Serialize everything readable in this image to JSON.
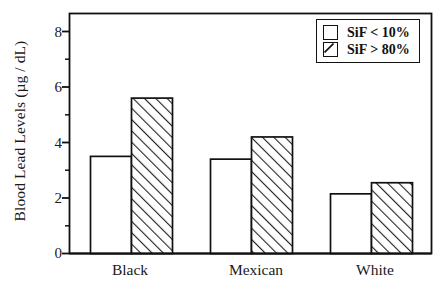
{
  "chart_data": {
    "type": "bar",
    "title": "",
    "subtitle": "",
    "xlabel": "",
    "ylabel": "Blood Lead Levels (µg / dL)",
    "categories": [
      "Black",
      "Mexican",
      "White"
    ],
    "series": [
      {
        "name": "SiF < 10%",
        "values": [
          3.5,
          3.4,
          2.15
        ],
        "fill": "open",
        "color": "#ffffff"
      },
      {
        "name": "SiF > 80%",
        "values": [
          5.6,
          4.2,
          2.55
        ],
        "fill": "hatched",
        "color": "#ffffff"
      }
    ],
    "ylim": [
      0,
      8.6
    ],
    "yticks": [
      0,
      2,
      4,
      6,
      8
    ],
    "ytick_labels": [
      "0",
      "2",
      "4",
      "6",
      "8"
    ],
    "yminor_ticks": [
      1,
      3,
      5,
      7
    ],
    "grid": false,
    "legend_position": "top-right",
    "frame": true,
    "axis_color": "#111111"
  },
  "axes": {
    "y_tick_labels": [
      "8",
      "6",
      "4",
      "2",
      "0"
    ],
    "x_tick_labels": [
      "Black",
      "Mexican",
      "White"
    ],
    "y_axis_title": "Blood Lead Levels (µg / dL)"
  },
  "legend": {
    "items": [
      {
        "label": "SiF < 10%",
        "swatch": "open-square"
      },
      {
        "label": "SiF > 80%",
        "swatch": "hatched-square"
      }
    ]
  }
}
